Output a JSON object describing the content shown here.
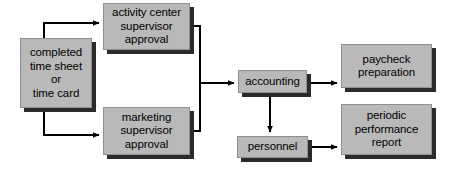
{
  "diagram": {
    "type": "flowchart",
    "title": "",
    "background_color": "#ffffff",
    "node_fill_color": "#b9b9b9",
    "node_border_color": "#8f8f8f",
    "node_shadow_color": "#2b2b2b",
    "connector_color": "#000000",
    "nodes": [
      {
        "id": "timesheet",
        "label": "completed\ntime sheet\nor\ntime card"
      },
      {
        "id": "activity_center",
        "label": "activity center\nsupervisor\napproval"
      },
      {
        "id": "marketing",
        "label": "marketing\nsupervisor\napproval"
      },
      {
        "id": "accounting",
        "label": "accounting"
      },
      {
        "id": "personnel",
        "label": "personnel"
      },
      {
        "id": "paycheck",
        "label": "paycheck\npreparation"
      },
      {
        "id": "report",
        "label": "periodic\nperformance\nreport"
      }
    ],
    "edges": [
      {
        "from": "timesheet",
        "to": "activity_center"
      },
      {
        "from": "timesheet",
        "to": "marketing"
      },
      {
        "from": "activity_center",
        "to": "accounting"
      },
      {
        "from": "marketing",
        "to": "accounting"
      },
      {
        "from": "accounting",
        "to": "paycheck"
      },
      {
        "from": "accounting",
        "to": "personnel"
      },
      {
        "from": "personnel",
        "to": "report"
      }
    ]
  }
}
